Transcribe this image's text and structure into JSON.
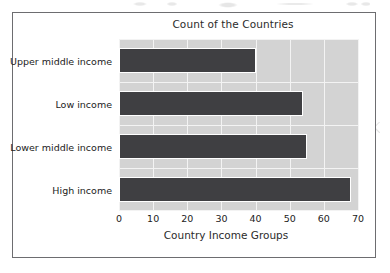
{
  "figure": {
    "title": "Count of the Countries",
    "xaxis_title": "Country Income Groups"
  },
  "chart_data": {
    "type": "bar",
    "orientation": "horizontal",
    "title": "Count of the Countries",
    "xlabel": "Country Income Groups",
    "ylabel": "",
    "categories": [
      "Upper middle income",
      "Low income",
      "Lower middle income",
      "High income"
    ],
    "values": [
      40,
      54,
      55,
      68
    ],
    "xlim": [
      0,
      70
    ],
    "xticks": [
      "0",
      "10",
      "20",
      "30",
      "40",
      "50",
      "60",
      "70"
    ],
    "xtick_values": [
      0,
      10,
      20,
      30,
      40,
      50,
      60,
      70
    ],
    "grid": true,
    "legend": null,
    "bar_color": "#3f3f42",
    "plot_background": "#d3d3d3",
    "gridline_color": "#f3f3f3"
  }
}
